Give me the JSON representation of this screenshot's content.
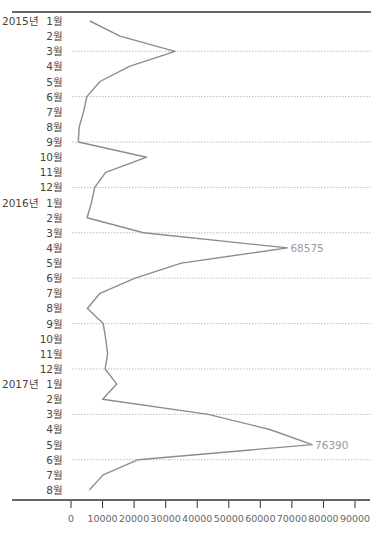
{
  "chart_data": {
    "type": "line",
    "orientation": "horizontal-time-vertical",
    "title": "",
    "title_note": "title cropped at top edge, not legible",
    "xlabel": "",
    "ylabel": "",
    "xlim": [
      0,
      90000
    ],
    "x_ticks": [
      0,
      10000,
      20000,
      30000,
      40000,
      50000,
      60000,
      70000,
      80000,
      90000
    ],
    "x_tick_labels": [
      "0",
      "10000",
      "20000",
      "30000",
      "40000",
      "50000",
      "60000",
      "70000",
      "80000",
      "90000"
    ],
    "grid": "dotted horizontal lines every 3 months (3월, 6월, 9월, 12월)",
    "categories": [
      "2015년 1월",
      "2월",
      "3월",
      "4월",
      "5월",
      "6월",
      "7월",
      "8월",
      "9월",
      "10월",
      "11월",
      "12월",
      "2016년 1월",
      "2월",
      "3월",
      "4월",
      "5월",
      "6월",
      "7월",
      "8월",
      "9월",
      "10월",
      "11월",
      "12월",
      "2017년 1월",
      "2월",
      "3월",
      "4월",
      "5월",
      "6월",
      "7월",
      "8월"
    ],
    "year_labels": [
      {
        "index": 0,
        "label": "2015년"
      },
      {
        "index": 12,
        "label": "2016년"
      },
      {
        "index": 24,
        "label": "2017년"
      }
    ],
    "month_labels": [
      "1월",
      "2월",
      "3월",
      "4월",
      "5월",
      "6월",
      "7월",
      "8월",
      "9월",
      "10월",
      "11월",
      "12월",
      "1월",
      "2월",
      "3월",
      "4월",
      "5월",
      "6월",
      "7월",
      "8월",
      "9월",
      "10월",
      "11月",
      "12월",
      "1월",
      "2월",
      "3월",
      "4월",
      "5월",
      "6월",
      "7월",
      "8월"
    ],
    "series": [
      {
        "name": "monthly",
        "color": "#8c8c8c",
        "values": [
          6000,
          15500,
          33000,
          18500,
          9200,
          5000,
          4000,
          2600,
          2300,
          24000,
          11000,
          7500,
          6500,
          5100,
          23000,
          68575,
          35000,
          20300,
          9200,
          5200,
          10200,
          11000,
          11600,
          10800,
          14500,
          10000,
          43500,
          63000,
          76390,
          21300,
          10200,
          5800
        ]
      }
    ],
    "annotations": [
      {
        "index": 15,
        "text": "68575"
      },
      {
        "index": 28,
        "text": "76390"
      }
    ]
  },
  "colors": {
    "line": "#8c8c8c",
    "axis": "#333333",
    "grid": "#bdbdbd",
    "label": "#444444",
    "annotation": "#9a9a9a"
  }
}
